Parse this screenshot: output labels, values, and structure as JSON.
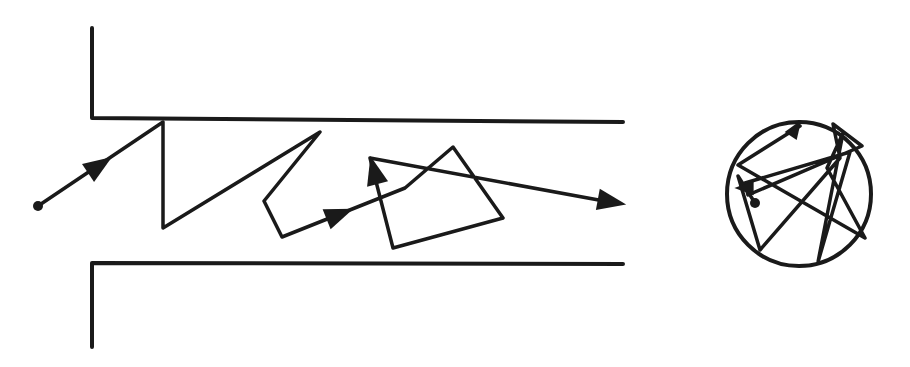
{
  "diagram": {
    "colors": {
      "line": "#1a1a1a",
      "background": "#ffffff"
    },
    "channel": {
      "top_wall": [
        [
          92,
          28
        ],
        [
          92,
          118
        ],
        [
          623,
          122
        ]
      ],
      "bottom_wall": [
        [
          623,
          264
        ],
        [
          92,
          263
        ],
        [
          92,
          347
        ]
      ],
      "path": [
        [
          38,
          206
        ],
        [
          163,
          122
        ],
        [
          163,
          228
        ],
        [
          320,
          132
        ],
        [
          264,
          201
        ],
        [
          282,
          237
        ],
        [
          405,
          188
        ],
        [
          453,
          147
        ],
        [
          503,
          218
        ],
        [
          393,
          248
        ],
        [
          370,
          158
        ],
        [
          615,
          203
        ]
      ],
      "start_dot": [
        38,
        206
      ],
      "arrows": [
        {
          "at": [
            100,
            165
          ],
          "dir": [
            125,
            -84
          ]
        },
        {
          "at": [
            340,
            214
          ],
          "dir": [
            123,
            -49
          ]
        },
        {
          "at": [
            374,
            170
          ],
          "dir": [
            -23,
            -90
          ]
        },
        {
          "at": [
            612,
            202
          ],
          "dir": [
            245,
            45
          ]
        }
      ]
    },
    "sphere": {
      "center": [
        799,
        194
      ],
      "radius": 72,
      "path": [
        [
          755,
          203
        ],
        [
          738,
          176
        ],
        [
          760,
          250
        ],
        [
          840,
          158
        ],
        [
          833,
          124
        ],
        [
          862,
          146
        ],
        [
          748,
          195
        ],
        [
          745,
          183
        ],
        [
          850,
          152
        ],
        [
          818,
          262
        ],
        [
          843,
          133
        ],
        [
          827,
          168
        ],
        [
          865,
          238
        ],
        [
          738,
          165
        ],
        [
          800,
          126
        ]
      ],
      "start_dot": [
        755,
        203
      ],
      "arrows": [
        {
          "at": [
            744,
            188
          ],
          "dir": [
            -1,
            0
          ]
        },
        {
          "at": [
            796,
            128
          ],
          "dir": [
            20,
            -30
          ]
        }
      ]
    }
  }
}
